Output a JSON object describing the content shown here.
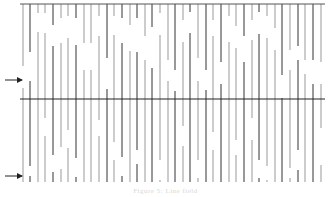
{
  "figure": {
    "top_border": {
      "x1": 20,
      "x2": 325,
      "y": 4,
      "color": "#555555"
    },
    "mid_line": {
      "x1": 20,
      "x2": 325,
      "y": 99,
      "color": "#222222"
    },
    "arrows": [
      {
        "name": "upper-arrow",
        "x1": 5,
        "x2": 22,
        "y": 80
      },
      {
        "name": "lower-arrow",
        "x1": 5,
        "x2": 22,
        "y": 176
      }
    ],
    "line_color_dark": "#333333",
    "line_color_light": "#999999",
    "columns": [
      {
        "x": 23,
        "segs": [
          [
            4,
            66
          ],
          [
            88,
            182
          ]
        ],
        "shade": "light"
      },
      {
        "x": 30,
        "segs": [
          [
            4,
            52
          ],
          [
            81,
            166
          ],
          [
            176,
            182
          ]
        ],
        "shade": "dark"
      },
      {
        "x": 38,
        "segs": [
          [
            4,
            13
          ],
          [
            32,
            182
          ]
        ],
        "shade": "light"
      },
      {
        "x": 45,
        "segs": [
          [
            4,
            13
          ],
          [
            33,
            118
          ],
          [
            136,
            182
          ]
        ],
        "shade": "light"
      },
      {
        "x": 53,
        "segs": [
          [
            4,
            25
          ],
          [
            46,
            155
          ],
          [
            172,
            182
          ]
        ],
        "shade": "dark"
      },
      {
        "x": 61,
        "segs": [
          [
            4,
            18
          ],
          [
            43,
            147
          ],
          [
            169,
            182
          ]
        ],
        "shade": "light"
      },
      {
        "x": 68,
        "segs": [
          [
            4,
            16
          ],
          [
            38,
            130
          ],
          [
            148,
            182
          ]
        ],
        "shade": "light"
      },
      {
        "x": 76,
        "segs": [
          [
            4,
            18
          ],
          [
            45,
            158
          ],
          [
            177,
            182
          ]
        ],
        "shade": "dark"
      },
      {
        "x": 84,
        "segs": [
          [
            4,
            43
          ],
          [
            70,
            182
          ]
        ],
        "shade": "light"
      },
      {
        "x": 91,
        "segs": [
          [
            4,
            43
          ],
          [
            70,
            182
          ]
        ],
        "shade": "light"
      },
      {
        "x": 99,
        "segs": [
          [
            4,
            16
          ],
          [
            36,
            120
          ],
          [
            136,
            182
          ]
        ],
        "shade": "light"
      },
      {
        "x": 107,
        "segs": [
          [
            4,
            58
          ],
          [
            89,
            182
          ]
        ],
        "shade": "dark"
      },
      {
        "x": 114,
        "segs": [
          [
            4,
            16
          ],
          [
            35,
            142
          ],
          [
            160,
            182
          ]
        ],
        "shade": "light"
      },
      {
        "x": 122,
        "segs": [
          [
            4,
            18
          ],
          [
            43,
            157
          ],
          [
            176,
            182
          ]
        ],
        "shade": "dark"
      },
      {
        "x": 130,
        "segs": [
          [
            4,
            25
          ],
          [
            51,
            182
          ]
        ],
        "shade": "light"
      },
      {
        "x": 137,
        "segs": [
          [
            4,
            18
          ],
          [
            52,
            150
          ],
          [
            164,
            182
          ]
        ],
        "shade": "dark"
      },
      {
        "x": 145,
        "segs": [
          [
            4,
            36
          ],
          [
            60,
            182
          ]
        ],
        "shade": "light"
      },
      {
        "x": 152,
        "segs": [
          [
            4,
            27
          ],
          [
            68,
            182
          ]
        ],
        "shade": "dark"
      },
      {
        "x": 160,
        "segs": [
          [
            4,
            13
          ],
          [
            35,
            160
          ],
          [
            180,
            182
          ]
        ],
        "shade": "light"
      },
      {
        "x": 168,
        "segs": [
          [
            4,
            60
          ],
          [
            81,
            182
          ]
        ],
        "shade": "light"
      },
      {
        "x": 175,
        "segs": [
          [
            4,
            70
          ],
          [
            91,
            182
          ]
        ],
        "shade": "dark"
      },
      {
        "x": 183,
        "segs": [
          [
            4,
            20
          ],
          [
            42,
            126
          ],
          [
            146,
            182
          ]
        ],
        "shade": "light"
      },
      {
        "x": 190,
        "segs": [
          [
            4,
            12
          ],
          [
            33,
            182
          ]
        ],
        "shade": "dark"
      },
      {
        "x": 198,
        "segs": [
          [
            4,
            58
          ],
          [
            81,
            160
          ],
          [
            178,
            182
          ]
        ],
        "shade": "light"
      },
      {
        "x": 206,
        "segs": [
          [
            4,
            70
          ],
          [
            90,
            182
          ]
        ],
        "shade": "dark"
      },
      {
        "x": 213,
        "segs": [
          [
            4,
            20
          ],
          [
            36,
            132
          ],
          [
            150,
            182
          ]
        ],
        "shade": "light"
      },
      {
        "x": 221,
        "segs": [
          [
            4,
            62
          ],
          [
            84,
            182
          ]
        ],
        "shade": "dark"
      },
      {
        "x": 229,
        "segs": [
          [
            4,
            16
          ],
          [
            42,
            182
          ]
        ],
        "shade": "light"
      },
      {
        "x": 236,
        "segs": [
          [
            4,
            26
          ],
          [
            48,
            140
          ],
          [
            155,
            182
          ]
        ],
        "shade": "light"
      },
      {
        "x": 244,
        "segs": [
          [
            4,
            36
          ],
          [
            62,
            182
          ]
        ],
        "shade": "dark"
      },
      {
        "x": 252,
        "segs": [
          [
            4,
            20
          ],
          [
            40,
            118
          ],
          [
            140,
            182
          ]
        ],
        "shade": "light"
      },
      {
        "x": 259,
        "segs": [
          [
            4,
            12
          ],
          [
            34,
            160
          ],
          [
            178,
            182
          ]
        ],
        "shade": "dark"
      },
      {
        "x": 267,
        "segs": [
          [
            4,
            16
          ],
          [
            38,
            166
          ],
          [
            180,
            182
          ]
        ],
        "shade": "light"
      },
      {
        "x": 275,
        "segs": [
          [
            4,
            28
          ],
          [
            50,
            182
          ]
        ],
        "shade": "light"
      },
      {
        "x": 282,
        "segs": [
          [
            4,
            75
          ],
          [
            98,
            182
          ]
        ],
        "shade": "dark"
      },
      {
        "x": 290,
        "segs": [
          [
            4,
            50
          ],
          [
            70,
            168
          ],
          [
            178,
            182
          ]
        ],
        "shade": "light"
      },
      {
        "x": 298,
        "segs": [
          [
            4,
            46
          ],
          [
            60,
            150
          ],
          [
            170,
            182
          ]
        ],
        "shade": "dark"
      },
      {
        "x": 305,
        "segs": [
          [
            4,
            60
          ],
          [
            74,
            182
          ]
        ],
        "shade": "light"
      },
      {
        "x": 313,
        "segs": [
          [
            4,
            60
          ],
          [
            84,
            182
          ]
        ],
        "shade": "dark"
      },
      {
        "x": 321,
        "segs": [
          [
            4,
            62
          ],
          [
            84,
            128
          ],
          [
            165,
            182
          ]
        ],
        "shade": "light"
      }
    ]
  },
  "caption": {
    "text": "Figure 5: Line field"
  }
}
